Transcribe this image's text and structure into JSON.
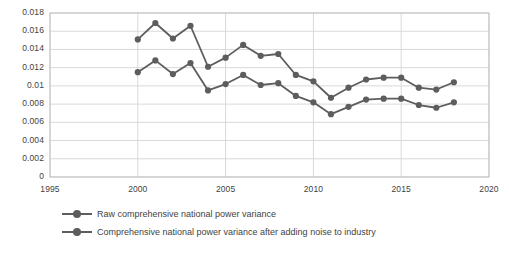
{
  "chart_data": {
    "type": "line",
    "title": "",
    "xlabel": "",
    "ylabel": "",
    "x": [
      2000,
      2001,
      2002,
      2003,
      2004,
      2005,
      2006,
      2007,
      2008,
      2009,
      2010,
      2011,
      2012,
      2013,
      2014,
      2015,
      2016,
      2017,
      2018
    ],
    "xlim": [
      1995,
      2020
    ],
    "ylim": [
      0,
      0.018
    ],
    "xticks": [
      "1995",
      "2000",
      "2005",
      "2010",
      "2015",
      "2020"
    ],
    "xtick_values": [
      1995,
      2000,
      2005,
      2010,
      2015,
      2020
    ],
    "yticks": [
      "0",
      "0.002",
      "0.004",
      "0.006",
      "0.008",
      "0.01",
      "0.012",
      "0.014",
      "0.016",
      "0.018"
    ],
    "ytick_values": [
      0,
      0.002,
      0.004,
      0.006,
      0.008,
      0.01,
      0.012,
      0.014,
      0.016,
      0.018
    ],
    "grid": "horizontal-and-vertical",
    "legend_position": "bottom",
    "series": [
      {
        "name": "Raw comprehensive national power variance",
        "color": "#5d5d5d",
        "marker": "circle",
        "values": [
          0.0151,
          0.0169,
          0.0152,
          0.0166,
          0.0121,
          0.0131,
          0.0145,
          0.0133,
          0.0135,
          0.0112,
          0.0105,
          0.0087,
          0.0098,
          0.0107,
          0.0109,
          0.0109,
          0.0098,
          0.0096,
          0.0104
        ]
      },
      {
        "name": "Comprehensive national power variance after adding noise to industry",
        "color": "#5d5d5d",
        "marker": "circle",
        "values": [
          0.0115,
          0.0128,
          0.0113,
          0.0125,
          0.0095,
          0.0102,
          0.0112,
          0.0101,
          0.0103,
          0.0089,
          0.0082,
          0.0069,
          0.0077,
          0.0085,
          0.0086,
          0.0086,
          0.0079,
          0.0076,
          0.0082
        ]
      }
    ]
  },
  "legend": {
    "items": [
      {
        "label": "Raw comprehensive national power variance"
      },
      {
        "label": "Comprehensive national power variance after adding noise to industry"
      }
    ]
  },
  "style": {
    "plot_border": "#bfbfbf",
    "gridline": "#d9d9d9",
    "text": "#3f3f3f",
    "series_color": "#5d5d5d",
    "background": "#ffffff"
  }
}
